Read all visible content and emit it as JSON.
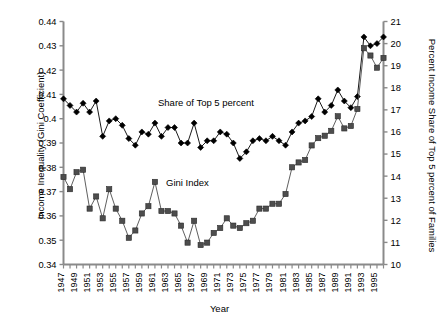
{
  "chart_data": {
    "type": "line",
    "title": "",
    "xlabel": "Year",
    "ylabel": "Income Inequality (Gini Coefficient)",
    "ylabel_right": "Percent Income Share of Top 5 percent of Families",
    "grid": false,
    "legend_position": "inline-annotation",
    "xlim": [
      1947,
      1996
    ],
    "ylim": [
      0.34,
      0.44
    ],
    "ylim_right": [
      10,
      21
    ],
    "ytick_labels": [
      "0.34",
      "0.35",
      "0.36",
      "0.37",
      "0.38",
      "0.39",
      "0.4",
      "0.41",
      "0.42",
      "0.43",
      "0.44"
    ],
    "ytick_values": [
      0.34,
      0.35,
      0.36,
      0.37,
      0.38,
      0.39,
      0.4,
      0.41,
      0.42,
      0.43,
      0.44
    ],
    "ytick_right_labels": [
      "10",
      "11",
      "12",
      "13",
      "14",
      "15",
      "16",
      "17",
      "18",
      "19",
      "20",
      "21"
    ],
    "ytick_right_values": [
      10,
      11,
      12,
      13,
      14,
      15,
      16,
      17,
      18,
      19,
      20,
      21
    ],
    "x": [
      1947,
      1948,
      1949,
      1950,
      1951,
      1952,
      1953,
      1954,
      1955,
      1956,
      1957,
      1958,
      1959,
      1960,
      1961,
      1962,
      1963,
      1964,
      1965,
      1966,
      1967,
      1968,
      1969,
      1970,
      1971,
      1972,
      1973,
      1974,
      1975,
      1976,
      1977,
      1978,
      1979,
      1980,
      1981,
      1982,
      1983,
      1984,
      1985,
      1986,
      1987,
      1988,
      1989,
      1990,
      1991,
      1992,
      1993,
      1994,
      1995,
      1996
    ],
    "xtick_labels": [
      "1947",
      "1949",
      "1951",
      "1953",
      "1955",
      "1957",
      "1959",
      "1961",
      "1963",
      "1965",
      "1967",
      "1969",
      "1971",
      "1973",
      "1975",
      "1977",
      "1979",
      "1981",
      "1983",
      "1985",
      "1987",
      "1989",
      "1991",
      "1993",
      "1995"
    ],
    "series": [
      {
        "name": "Share of Top 5 percent",
        "axis": "right",
        "marker": "diamond",
        "color": "#000000",
        "values": [
          17.5,
          17.2,
          16.9,
          17.3,
          16.9,
          17.4,
          15.8,
          16.5,
          16.6,
          16.3,
          15.7,
          15.4,
          16.0,
          15.9,
          16.4,
          15.8,
          16.2,
          16.2,
          15.5,
          15.5,
          16.4,
          15.3,
          15.6,
          15.6,
          16.0,
          15.9,
          15.5,
          14.8,
          15.1,
          15.6,
          15.7,
          15.6,
          15.8,
          15.6,
          15.4,
          16.0,
          16.4,
          16.5,
          16.7,
          17.5,
          16.9,
          17.2,
          17.9,
          17.4,
          17.1,
          17.6,
          20.3,
          19.9,
          20.0,
          20.3
        ]
      },
      {
        "name": "Gini Index",
        "axis": "left",
        "marker": "square",
        "color": "#4d4d4d",
        "values": [
          0.376,
          0.371,
          0.378,
          0.379,
          0.363,
          0.368,
          0.359,
          0.371,
          0.363,
          0.358,
          0.351,
          0.354,
          0.361,
          0.364,
          0.374,
          0.362,
          0.362,
          0.361,
          0.356,
          0.349,
          0.358,
          0.348,
          0.349,
          0.353,
          0.355,
          0.359,
          0.356,
          0.355,
          0.357,
          0.358,
          0.363,
          0.363,
          0.365,
          0.365,
          0.369,
          0.38,
          0.382,
          0.383,
          0.389,
          0.392,
          0.393,
          0.395,
          0.401,
          0.396,
          0.397,
          0.404,
          0.429,
          0.426,
          0.421,
          0.425
        ]
      }
    ],
    "annotations": [
      {
        "text": "Share of Top 5 percent",
        "series": "Share of Top 5 percent"
      },
      {
        "text": "Gini Index",
        "series": "Gini Index"
      }
    ]
  },
  "axes": {
    "x_title": "Year",
    "y_left_title": "Income Inequality (Gini Coefficient)",
    "y_right_title": "Percent Income Share of Top 5 percent of Families"
  },
  "labels": {
    "note_top5": "Share of Top 5 percent",
    "note_gini": "Gini Index"
  },
  "colors": {
    "axis": "#8a8a8a",
    "series_top5": "#000000",
    "series_gini": "#4d4d4d",
    "background": "#ffffff"
  }
}
